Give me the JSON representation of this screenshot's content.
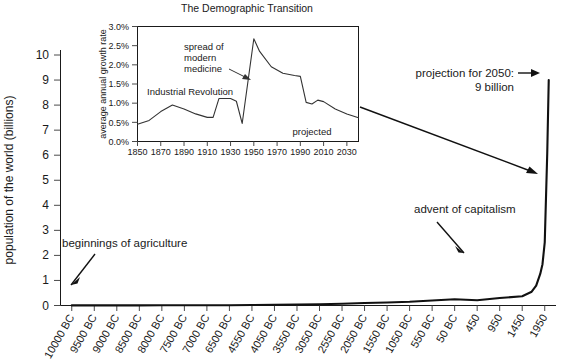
{
  "chart_data": [
    {
      "id": "main",
      "type": "line",
      "title": "",
      "xlabel": "",
      "ylabel": "population of the world (billions)",
      "ylim": [
        0,
        10
      ],
      "yticks": [
        0,
        1,
        2,
        3,
        4,
        5,
        6,
        7,
        8,
        9,
        10
      ],
      "ytick_labels": [
        "0",
        "1",
        "2",
        "3",
        "4",
        "5",
        "6",
        "7",
        "8",
        "9",
        "10"
      ],
      "grid": false,
      "legend": "none",
      "xtick_labels": [
        "10000 BC",
        "9500 BC",
        "9000 BC",
        "8500 BC",
        "8000 BC",
        "7500 BC",
        "7000 BC",
        "6500 BC",
        "4550 BC",
        "4050 BC",
        "3550 BC",
        "3050 BC",
        "2550 BC",
        "2050 BC",
        "1550 BC",
        "1050 BC",
        "550 BC",
        "50 BC",
        "450",
        "950",
        "1450",
        "1950"
      ],
      "series": [
        {
          "name": "population of the world (billions)",
          "x": [
            "10000 BC",
            "9500 BC",
            "9000 BC",
            "8500 BC",
            "8000 BC",
            "7500 BC",
            "7000 BC",
            "6500 BC",
            "4550 BC",
            "4050 BC",
            "3550 BC",
            "3050 BC",
            "2550 BC",
            "2050 BC",
            "1550 BC",
            "1050 BC",
            "550 BC",
            "50 BC",
            "450",
            "950",
            "1450",
            "1650",
            "1750",
            "1850",
            "1900",
            "1950",
            "2000",
            "2050"
          ],
          "values": [
            0.004,
            0.005,
            0.005,
            0.006,
            0.007,
            0.008,
            0.01,
            0.012,
            0.02,
            0.03,
            0.04,
            0.05,
            0.07,
            0.1,
            0.12,
            0.15,
            0.2,
            0.25,
            0.21,
            0.3,
            0.37,
            0.55,
            0.79,
            1.26,
            1.65,
            2.52,
            6.08,
            9.0
          ]
        }
      ],
      "annotations": [
        {
          "text": "beginnings of agriculture",
          "arrow": "down-left"
        },
        {
          "text": "advent of capitalism",
          "arrow": "down-right"
        },
        {
          "text_line1": "projection for 2050:",
          "text_line2": "9 billion",
          "arrow": "right"
        }
      ]
    },
    {
      "id": "inset",
      "type": "line",
      "title": "The Demographic Transition",
      "xlabel": "",
      "ylabel": "average annual growth rate",
      "ylim": [
        0.0,
        3.0
      ],
      "yticks": [
        0.0,
        0.5,
        1.0,
        1.5,
        2.0,
        2.5,
        3.0
      ],
      "ytick_labels": [
        "0.0%",
        "0.5%",
        "1.0%",
        "1.5%",
        "2.0%",
        "2.5%",
        "3.0%"
      ],
      "xlim": [
        1850,
        2040
      ],
      "xticks": [
        1850,
        1870,
        1890,
        1910,
        1930,
        1950,
        1970,
        1990,
        2010,
        2030
      ],
      "xtick_labels": [
        "1850",
        "1870",
        "1890",
        "1910",
        "1930",
        "1950",
        "1970",
        "1990",
        "2010",
        "2030"
      ],
      "grid": false,
      "legend": "none",
      "series": [
        {
          "name": "average annual growth rate",
          "x": [
            1850,
            1860,
            1870,
            1880,
            1890,
            1900,
            1910,
            1915,
            1920,
            1930,
            1935,
            1940,
            1950,
            1955,
            1965,
            1975,
            1985,
            1990,
            1995,
            2000,
            2005,
            2010,
            2020,
            2030,
            2040
          ],
          "values": [
            0.45,
            0.55,
            0.78,
            0.95,
            0.85,
            0.72,
            0.63,
            0.63,
            1.12,
            1.12,
            1.05,
            0.47,
            2.68,
            2.35,
            1.95,
            1.78,
            1.72,
            1.7,
            1.02,
            0.98,
            1.08,
            1.04,
            0.85,
            0.72,
            0.62
          ]
        }
      ],
      "annotations": [
        {
          "text_line1": "spread of",
          "text_line2": "modern",
          "text_line3": "medicine",
          "arrow": "down-right"
        },
        {
          "text": "Industrial Revolution",
          "arrow": "none"
        },
        {
          "text": "projected",
          "arrow": "none"
        }
      ]
    }
  ],
  "figure": {
    "background_color": "#ffffff",
    "line_color": "#111111",
    "axis_color": "#1a1a1a"
  }
}
